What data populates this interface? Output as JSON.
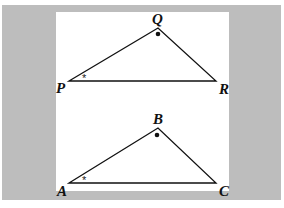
{
  "figure": {
    "triangles": [
      {
        "name": "PQR",
        "vertices": {
          "left": "P",
          "top": "Q",
          "right": "R"
        },
        "angle_marks": {
          "left": "*",
          "top": "dot"
        }
      },
      {
        "name": "ABC",
        "vertices": {
          "left": "A",
          "top": "B",
          "right": "C"
        },
        "angle_marks": {
          "left": "*",
          "top": "dot"
        }
      }
    ],
    "colors": {
      "background": "#bdbdbd",
      "panel": "#ffffff",
      "stroke": "#111111"
    }
  }
}
